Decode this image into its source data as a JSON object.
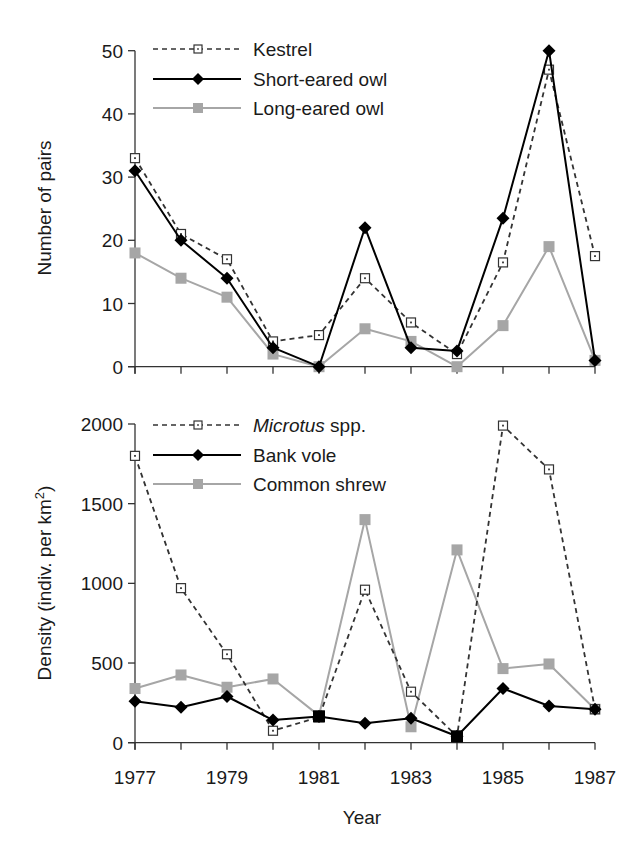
{
  "chart_data": [
    {
      "type": "line",
      "title": "",
      "xlabel": "",
      "ylabel": "Number of pairs",
      "x": [
        1977,
        1978,
        1979,
        1980,
        1981,
        1982,
        1983,
        1984,
        1985,
        1986,
        1987
      ],
      "xlim": [
        1977,
        1987
      ],
      "ylim": [
        0,
        50
      ],
      "yticks": [
        0,
        10,
        20,
        30,
        40,
        50
      ],
      "xtick_labels_shown": false,
      "grid": false,
      "legend_position": "upper left",
      "series": [
        {
          "name": "Kestrel",
          "style": "dashed",
          "marker": "open-square-dot",
          "color": "#333333",
          "values": [
            33,
            21,
            17,
            4,
            5,
            14,
            7,
            2,
            16.5,
            47,
            17.5
          ]
        },
        {
          "name": "Short-eared owl",
          "style": "solid",
          "marker": "filled-diamond",
          "color": "#000000",
          "values": [
            31,
            20,
            14,
            3,
            0,
            22,
            3,
            2.5,
            23.5,
            50,
            1
          ]
        },
        {
          "name": "Long-eared owl",
          "style": "solid",
          "marker": "filled-square",
          "color": "#a6a6a6",
          "values": [
            18,
            14,
            11,
            2,
            0,
            6,
            4,
            0,
            6.5,
            19,
            1
          ]
        }
      ]
    },
    {
      "type": "line",
      "title": "",
      "xlabel": "Year",
      "ylabel": "Density (indiv. per km²)",
      "x": [
        1977,
        1978,
        1979,
        1980,
        1981,
        1982,
        1983,
        1984,
        1985,
        1986,
        1987
      ],
      "xlim": [
        1977,
        1987
      ],
      "ylim": [
        0,
        2000
      ],
      "yticks": [
        0,
        500,
        1000,
        1500,
        2000
      ],
      "xtick_labels": [
        "1977",
        "1979",
        "1981",
        "1983",
        "1985",
        "1987"
      ],
      "grid": false,
      "legend_position": "upper left",
      "series": [
        {
          "name": "Microtus spp.",
          "style": "dashed",
          "marker": "open-square-dot",
          "color": "#333333",
          "values": [
            1800,
            970,
            555,
            75,
            160,
            960,
            320,
            40,
            1990,
            1715,
            210
          ]
        },
        {
          "name": "Bank vole",
          "style": "solid",
          "marker": "filled-diamond",
          "color": "#000000",
          "values": [
            260,
            222,
            290,
            142,
            165,
            122,
            153,
            40,
            340,
            230,
            210
          ]
        },
        {
          "name": "Common shrew",
          "style": "solid",
          "marker": "filled-square",
          "color": "#a6a6a6",
          "values": [
            340,
            425,
            348,
            400,
            170,
            1400,
            100,
            1210,
            465,
            494,
            210
          ]
        }
      ]
    }
  ],
  "top_panel": {
    "ylabel": "Number of pairs",
    "yticks": [
      "0",
      "10",
      "20",
      "30",
      "40",
      "50"
    ],
    "legend": [
      {
        "label": "Kestrel"
      },
      {
        "label": "Short-eared owl"
      },
      {
        "label": "Long-eared owl"
      }
    ]
  },
  "bottom_panel": {
    "ylabel_main": "Density (indiv. per km",
    "ylabel_sup": "2",
    "ylabel_end": ")",
    "yticks": [
      "0",
      "500",
      "1000",
      "1500",
      "2000"
    ],
    "xticks": [
      "1977",
      "1979",
      "1981",
      "1983",
      "1985",
      "1987"
    ],
    "xlabel": "Year",
    "legend": [
      {
        "label_italic": "Microtus",
        "label": " spp."
      },
      {
        "label": "Bank vole"
      },
      {
        "label": "Common shrew"
      }
    ]
  },
  "colors": {
    "dashed_series": "#333333",
    "black_series": "#000000",
    "grey_series": "#a6a6a6",
    "axis": "#333333"
  }
}
